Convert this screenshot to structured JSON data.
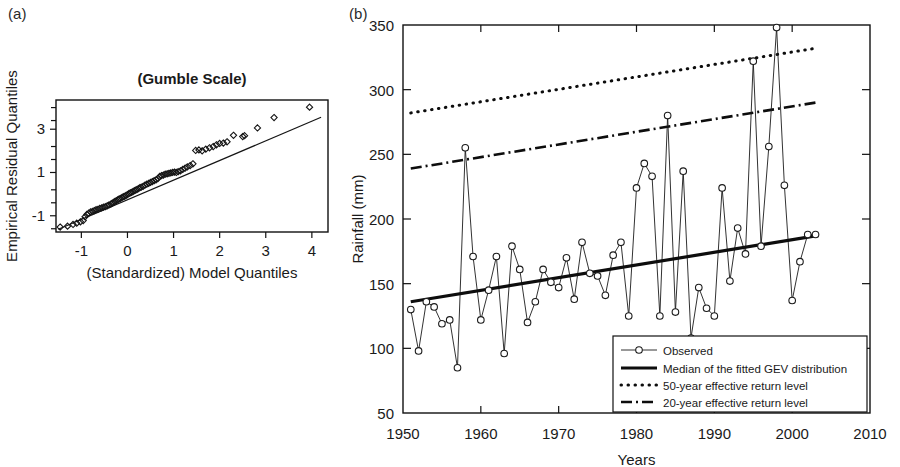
{
  "figure": {
    "panel_a_tag": "(a)",
    "panel_b_tag": "(b)"
  },
  "chart_data": [
    {
      "type": "scatter",
      "panel": "(a)",
      "title": "(Gumble Scale)",
      "xlabel": "(Standardized) Model Quantiles",
      "ylabel": "Empirical Residual Quantiles",
      "xlim": [
        -1.55,
        4.35
      ],
      "ylim": [
        -1.75,
        4.35
      ],
      "xticks": [
        -1,
        0,
        1,
        2,
        3,
        4
      ],
      "xtick_labels": [
        "-1",
        "0",
        "1",
        "2",
        "3",
        "4"
      ],
      "yticks": [
        -1,
        1,
        3
      ],
      "ytick_labels": [
        "-1",
        "1",
        "3"
      ],
      "yminorticks": [
        -1.6,
        -0.4,
        0.2,
        1.6,
        2.2,
        3.4,
        4.0
      ],
      "grid": false,
      "legend": "none",
      "reference_line": {
        "name": "1:1 reference line",
        "x": [
          -1.5,
          4.2
        ],
        "y": [
          -1.62,
          3.55
        ]
      },
      "marker": "diamond",
      "points": [
        {
          "x": -1.46,
          "y": -1.52
        },
        {
          "x": -1.3,
          "y": -1.48
        },
        {
          "x": -1.18,
          "y": -1.4
        },
        {
          "x": -1.1,
          "y": -1.34
        },
        {
          "x": -1.02,
          "y": -1.28
        },
        {
          "x": -0.96,
          "y": -1.22
        },
        {
          "x": -0.92,
          "y": -1.05
        },
        {
          "x": -0.88,
          "y": -0.94
        },
        {
          "x": -0.84,
          "y": -0.88
        },
        {
          "x": -0.8,
          "y": -0.82
        },
        {
          "x": -0.76,
          "y": -0.8
        },
        {
          "x": -0.72,
          "y": -0.76
        },
        {
          "x": -0.68,
          "y": -0.72
        },
        {
          "x": -0.64,
          "y": -0.7
        },
        {
          "x": -0.6,
          "y": -0.66
        },
        {
          "x": -0.56,
          "y": -0.64
        },
        {
          "x": -0.52,
          "y": -0.6
        },
        {
          "x": -0.48,
          "y": -0.58
        },
        {
          "x": -0.44,
          "y": -0.54
        },
        {
          "x": -0.4,
          "y": -0.5
        },
        {
          "x": -0.36,
          "y": -0.46
        },
        {
          "x": -0.33,
          "y": -0.42
        },
        {
          "x": -0.3,
          "y": -0.38
        },
        {
          "x": -0.27,
          "y": -0.34
        },
        {
          "x": -0.24,
          "y": -0.3
        },
        {
          "x": -0.21,
          "y": -0.26
        },
        {
          "x": -0.18,
          "y": -0.22
        },
        {
          "x": -0.15,
          "y": -0.2
        },
        {
          "x": -0.12,
          "y": -0.16
        },
        {
          "x": -0.09,
          "y": -0.12
        },
        {
          "x": -0.06,
          "y": -0.1
        },
        {
          "x": -0.03,
          "y": -0.06
        },
        {
          "x": 0.0,
          "y": -0.02
        },
        {
          "x": 0.03,
          "y": 0.02
        },
        {
          "x": 0.06,
          "y": 0.06
        },
        {
          "x": 0.09,
          "y": 0.08
        },
        {
          "x": 0.12,
          "y": 0.12
        },
        {
          "x": 0.15,
          "y": 0.16
        },
        {
          "x": 0.18,
          "y": 0.18
        },
        {
          "x": 0.21,
          "y": 0.22
        },
        {
          "x": 0.24,
          "y": 0.26
        },
        {
          "x": 0.27,
          "y": 0.3
        },
        {
          "x": 0.3,
          "y": 0.32
        },
        {
          "x": 0.34,
          "y": 0.36
        },
        {
          "x": 0.38,
          "y": 0.42
        },
        {
          "x": 0.42,
          "y": 0.46
        },
        {
          "x": 0.46,
          "y": 0.5
        },
        {
          "x": 0.5,
          "y": 0.54
        },
        {
          "x": 0.54,
          "y": 0.58
        },
        {
          "x": 0.58,
          "y": 0.62
        },
        {
          "x": 0.62,
          "y": 0.66
        },
        {
          "x": 0.66,
          "y": 0.72
        },
        {
          "x": 0.7,
          "y": 0.82
        },
        {
          "x": 0.74,
          "y": 0.86
        },
        {
          "x": 0.78,
          "y": 0.88
        },
        {
          "x": 0.82,
          "y": 0.92
        },
        {
          "x": 0.86,
          "y": 0.94
        },
        {
          "x": 0.9,
          "y": 0.96
        },
        {
          "x": 0.94,
          "y": 0.98
        },
        {
          "x": 0.98,
          "y": 1.0
        },
        {
          "x": 1.02,
          "y": 1.02
        },
        {
          "x": 1.06,
          "y": 1.0
        },
        {
          "x": 1.1,
          "y": 1.04
        },
        {
          "x": 1.15,
          "y": 1.08
        },
        {
          "x": 1.2,
          "y": 1.14
        },
        {
          "x": 1.25,
          "y": 1.2
        },
        {
          "x": 1.3,
          "y": 1.26
        },
        {
          "x": 1.36,
          "y": 1.32
        },
        {
          "x": 1.42,
          "y": 1.4
        },
        {
          "x": 1.48,
          "y": 2.02
        },
        {
          "x": 1.55,
          "y": 2.04
        },
        {
          "x": 1.62,
          "y": 2.0
        },
        {
          "x": 1.7,
          "y": 2.08
        },
        {
          "x": 1.78,
          "y": 2.14
        },
        {
          "x": 1.86,
          "y": 2.2
        },
        {
          "x": 1.93,
          "y": 2.28
        },
        {
          "x": 2.0,
          "y": 2.34
        },
        {
          "x": 2.08,
          "y": 2.36
        },
        {
          "x": 2.16,
          "y": 2.42
        },
        {
          "x": 2.3,
          "y": 2.72
        },
        {
          "x": 2.5,
          "y": 2.66
        },
        {
          "x": 2.54,
          "y": 2.7
        },
        {
          "x": 2.82,
          "y": 3.06
        },
        {
          "x": 3.18,
          "y": 3.54
        },
        {
          "x": 3.95,
          "y": 4.02
        }
      ]
    },
    {
      "type": "line",
      "panel": "(b)",
      "title": "",
      "xlabel": "Years",
      "ylabel": "Rainfall (mm)",
      "xlim": [
        1950,
        2010
      ],
      "ylim": [
        50,
        350
      ],
      "xticks": [
        1950,
        1960,
        1970,
        1980,
        1990,
        2000,
        2010
      ],
      "xtick_labels": [
        "1950",
        "1960",
        "1970",
        "1980",
        "1990",
        "2000",
        "2010"
      ],
      "yticks": [
        50,
        100,
        150,
        200,
        250,
        300,
        350
      ],
      "ytick_labels": [
        "50",
        "100",
        "150",
        "200",
        "250",
        "300",
        "350"
      ],
      "grid": false,
      "legend_position": "bottom-right",
      "series": [
        {
          "name": "Observed",
          "style": "line-with-circle-markers",
          "x": [
            1951,
            1952,
            1953,
            1954,
            1955,
            1956,
            1957,
            1958,
            1959,
            1960,
            1961,
            1962,
            1963,
            1964,
            1965,
            1966,
            1967,
            1968,
            1969,
            1970,
            1971,
            1972,
            1973,
            1974,
            1975,
            1976,
            1977,
            1978,
            1979,
            1980,
            1981,
            1982,
            1983,
            1984,
            1985,
            1986,
            1987,
            1988,
            1989,
            1990,
            1991,
            1992,
            1993,
            1994,
            1995,
            1996,
            1997,
            1998,
            1999,
            2000,
            2001,
            2002,
            2003
          ],
          "values": [
            130,
            98,
            136,
            132,
            119,
            122,
            85,
            255,
            171,
            122,
            145,
            171,
            96,
            179,
            161,
            120,
            136,
            161,
            151,
            147,
            170,
            138,
            182,
            158,
            156,
            141,
            172,
            182,
            125,
            224,
            243,
            233,
            125,
            280,
            128,
            237,
            108,
            147,
            131,
            125,
            224,
            152,
            193,
            173,
            322,
            179,
            256,
            348,
            226,
            137,
            167,
            188,
            188
          ]
        },
        {
          "name": "Median of the fitted GEV distribution",
          "style": "solid-thick",
          "x": [
            1951,
            2003
          ],
          "values": [
            136,
            187
          ]
        },
        {
          "name": "50-year effective return level",
          "style": "dotted",
          "x": [
            1951,
            2003
          ],
          "values": [
            282,
            332
          ]
        },
        {
          "name": "20-year effective return level",
          "style": "dash-dot",
          "x": [
            1951,
            2003
          ],
          "values": [
            239,
            290
          ]
        }
      ],
      "legend_entries": [
        {
          "label": "Observed",
          "style": "line-with-circle-markers"
        },
        {
          "label": "Median of the fitted GEV distribution",
          "style": "solid-thick"
        },
        {
          "label": "50-year effective return level",
          "style": "dotted"
        },
        {
          "label": "20-year effective return level",
          "style": "dash-dot"
        }
      ]
    }
  ]
}
